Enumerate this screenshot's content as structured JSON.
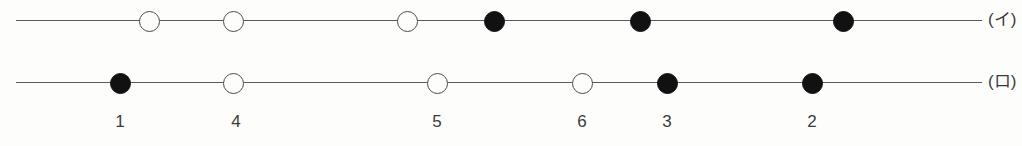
{
  "diagram": {
    "type": "node-sequence-diagram",
    "background_color": "#fdfdfc",
    "line_color": "#5a5a5c",
    "filled_node_color": "#111111",
    "open_node_color": "#fdfdfc",
    "node_border_color": "#4b4b4d",
    "node_diameter": 21,
    "line_start_x": 16,
    "line_end_x": 982,
    "rows": [
      {
        "id": "row-i",
        "label": "(イ)",
        "label_x": 988,
        "line_y": 20,
        "nodes": [
          {
            "index": 1,
            "x": 149,
            "fill": "open"
          },
          {
            "index": 2,
            "x": 233,
            "fill": "open"
          },
          {
            "index": 3,
            "x": 407,
            "fill": "open"
          },
          {
            "index": 4,
            "x": 494,
            "fill": "filled"
          },
          {
            "index": 5,
            "x": 640,
            "fill": "filled"
          },
          {
            "index": 6,
            "x": 843,
            "fill": "filled"
          }
        ]
      },
      {
        "id": "row-ro",
        "label": "(ロ)",
        "label_x": 988,
        "line_y": 82,
        "nodes": [
          {
            "index": 1,
            "x": 120,
            "fill": "filled"
          },
          {
            "index": 2,
            "x": 233,
            "fill": "open"
          },
          {
            "index": 3,
            "x": 437,
            "fill": "open"
          },
          {
            "index": 4,
            "x": 582,
            "fill": "open"
          },
          {
            "index": 5,
            "x": 667,
            "fill": "filled"
          },
          {
            "index": 6,
            "x": 812,
            "fill": "filled"
          }
        ]
      }
    ],
    "tick_labels": [
      {
        "text": "1",
        "x": 120,
        "y": 113
      },
      {
        "text": "4",
        "x": 236,
        "y": 113
      },
      {
        "text": "5",
        "x": 437,
        "y": 113
      },
      {
        "text": "6",
        "x": 582,
        "y": 113
      },
      {
        "text": "3",
        "x": 667,
        "y": 113
      },
      {
        "text": "2",
        "x": 812,
        "y": 113
      }
    ]
  }
}
